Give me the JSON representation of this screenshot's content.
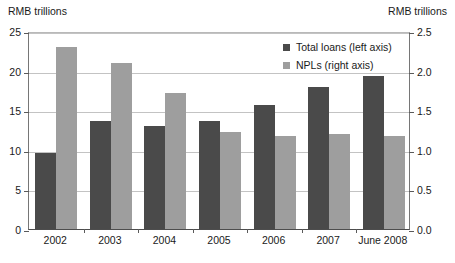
{
  "chart_data": {
    "type": "bar",
    "title": "",
    "subtitle": "",
    "xlabel": "",
    "ylabel": "RMB trillions",
    "y2label": "RMB trillions",
    "categories": [
      "2002",
      "2003",
      "2004",
      "2005",
      "2006",
      "2007",
      "June 2008"
    ],
    "series": [
      {
        "name": "Total loans (left axis)",
        "axis": "left",
        "color": "#4a4a4a",
        "values": [
          9.6,
          13.7,
          13.0,
          13.7,
          15.6,
          17.9,
          19.3
        ]
      },
      {
        "name": "NPLs (right axis)",
        "axis": "right",
        "color": "#9e9e9e",
        "values": [
          2.3,
          2.1,
          1.72,
          1.22,
          1.17,
          1.2,
          1.18
        ]
      }
    ],
    "ylim": [
      0,
      25
    ],
    "y2lim": [
      0.0,
      2.5
    ],
    "yticks": [
      "0",
      "5",
      "10",
      "15",
      "20",
      "25"
    ],
    "ytick_values": [
      0,
      5,
      10,
      15,
      20,
      25
    ],
    "y2ticks": [
      "0.0",
      "0.5",
      "1.0",
      "1.5",
      "2.0",
      "2.5"
    ],
    "y2tick_values": [
      0.0,
      0.5,
      1.0,
      1.5,
      2.0,
      2.5
    ],
    "grid": true,
    "legend_position": "upper-right-inside"
  },
  "axis_captions": {
    "left_unit": "RMB trillions",
    "right_unit": "RMB trillions"
  },
  "legend": {
    "entries": [
      {
        "label": "Total loans (left axis)",
        "swatch": "dark-gray-swatch-icon"
      },
      {
        "label": "NPLs (right axis)",
        "swatch": "light-gray-swatch-icon"
      }
    ]
  }
}
